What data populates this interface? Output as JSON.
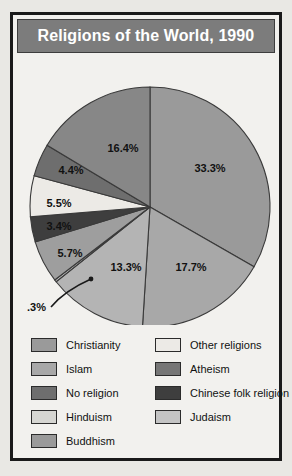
{
  "title": "Religions of the World, 1990",
  "colors": {
    "banner": "#7c7c7c",
    "frame": "#1a1a1a",
    "page_background": "#e9e8e4",
    "panel_background": "#f2f1ee",
    "slice_outline": "#3a3a3a",
    "label_text": "#111111",
    "title_text": "#ffffff"
  },
  "chart_data": {
    "type": "pie",
    "title": "Religions of the World, 1990",
    "xlabel": "",
    "ylabel": "",
    "legend_position": "bottom",
    "grid": false,
    "start_angle_deg": 0,
    "direction": "clockwise",
    "categories": [
      "Christianity",
      "Islam",
      "No religion",
      "Judaism",
      "Hinduism",
      "Buddhism",
      "Other religions",
      "Atheism",
      "Chinese folk religion"
    ],
    "values": [
      33.3,
      17.7,
      13.3,
      0.3,
      5.7,
      3.4,
      5.5,
      4.4,
      16.4
    ],
    "value_labels": [
      "33.3%",
      "17.7%",
      "13.3%",
      ".3%",
      "5.7%",
      "3.4%",
      "5.5%",
      "4.4%",
      "16.4%"
    ],
    "slice_colors": [
      "#9a9a9a",
      "#a8a8a8",
      "#b4b4b4",
      "#c4c4c4",
      "#9e9e9e",
      "#3e3e3e",
      "#eceae6",
      "#6e6e6e",
      "#878787"
    ],
    "annotations": [
      {
        "text": ".3%",
        "for": "Judaism",
        "style": "leader-line-callout"
      }
    ]
  },
  "pie_labels": [
    {
      "text": "33.3%",
      "x": 197,
      "y": 153
    },
    {
      "text": "17.7%",
      "x": 178,
      "y": 252
    },
    {
      "text": "13.3%",
      "x": 113,
      "y": 252
    },
    {
      "text": "5.7%",
      "x": 57,
      "y": 238
    },
    {
      "text": "3.4%",
      "x": 46,
      "y": 211
    },
    {
      "text": "5.5%",
      "x": 46,
      "y": 188
    },
    {
      "text": "4.4%",
      "x": 58,
      "y": 155
    },
    {
      "text": "16.4%",
      "x": 110,
      "y": 133
    }
  ],
  "callout": {
    "text": ".3%"
  },
  "legend": {
    "left_column": [
      {
        "label": "Christianity",
        "color": "#9a9a9a"
      },
      {
        "label": "Islam",
        "color": "#a8a8a8"
      },
      {
        "label": "No religion",
        "color": "#6e6e6e"
      },
      {
        "label": "Hinduism",
        "color": "#d6d6d2"
      },
      {
        "label": "Buddhism",
        "color": "#9a9a9a"
      }
    ],
    "right_column": [
      {
        "label": "Other religions",
        "color": "#eceae6"
      },
      {
        "label": "Atheism",
        "color": "#767676"
      },
      {
        "label": "Chinese folk religion",
        "color": "#3e3e3e"
      },
      {
        "label": "Judaism",
        "color": "#c4c4c4"
      }
    ]
  }
}
